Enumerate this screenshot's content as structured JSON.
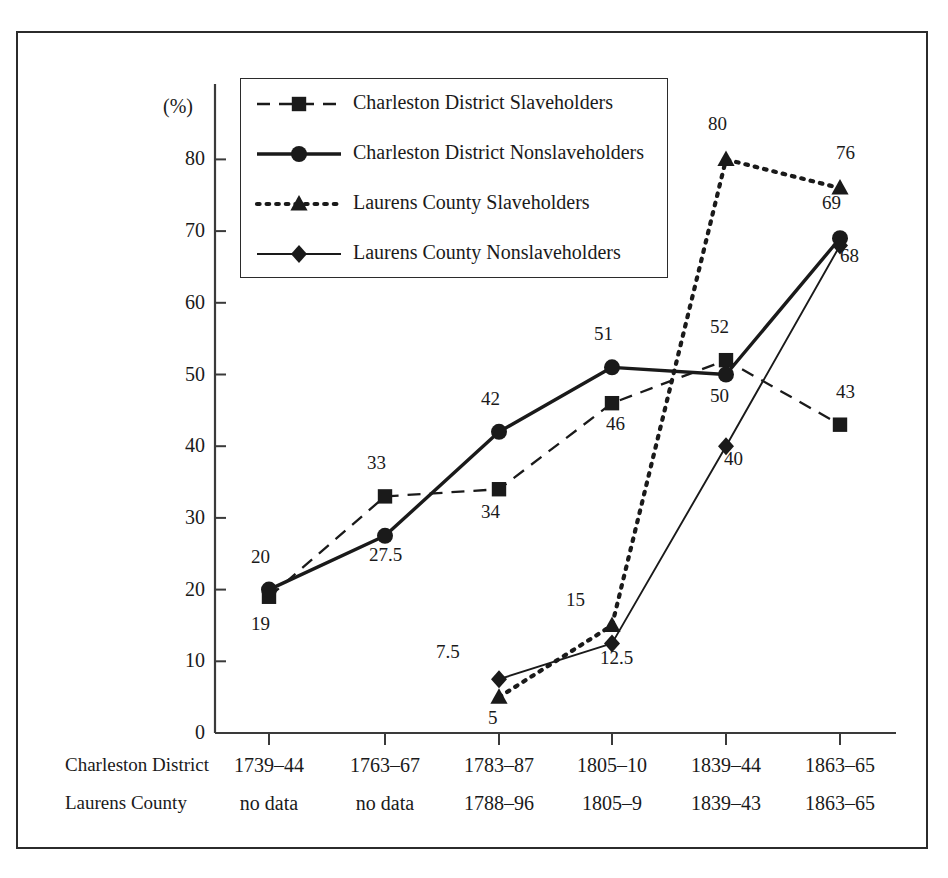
{
  "chart_data": {
    "type": "line",
    "title": "",
    "xlabel": "",
    "ylabel": "(%)",
    "ylim": [
      0,
      85
    ],
    "yticks": [
      0,
      10,
      20,
      30,
      40,
      50,
      60,
      70,
      80
    ],
    "grid": false,
    "legend_position": "top-left-inside",
    "categories": [
      "1",
      "2",
      "3",
      "4",
      "5",
      "6"
    ],
    "axis_rows": [
      {
        "row_label": "Charleston District",
        "values": [
          "1739–44",
          "1763–67",
          "1783–87",
          "1805–10",
          "1839–44",
          "1863–65"
        ]
      },
      {
        "row_label": "Laurens County",
        "values": [
          "no data",
          "no data",
          "1788–96",
          "1805–9",
          "1839–43",
          "1863–65"
        ]
      }
    ],
    "series": [
      {
        "name": "Charleston District Slaveholders",
        "marker": "square",
        "line_style": "dashed",
        "values": [
          19,
          33,
          34,
          46,
          52,
          43
        ],
        "labels": [
          "19",
          "33",
          "34",
          "46",
          "52",
          "43"
        ]
      },
      {
        "name": "Charleston District Nonslaveholders",
        "marker": "circle",
        "line_style": "solid-thick",
        "values": [
          20,
          27.5,
          42,
          51,
          50,
          69
        ],
        "labels": [
          "20",
          "27.5",
          "42",
          "51",
          "50",
          "69"
        ]
      },
      {
        "name": "Laurens County Slaveholders",
        "marker": "triangle",
        "line_style": "dotted",
        "values": [
          null,
          null,
          5,
          15,
          80,
          76
        ],
        "labels": [
          "",
          "",
          "5",
          "15",
          "80",
          "76"
        ]
      },
      {
        "name": "Laurens County Nonslaveholders",
        "marker": "diamond",
        "line_style": "solid-thin",
        "values": [
          null,
          null,
          7.5,
          12.5,
          40,
          68
        ],
        "labels": [
          "",
          "",
          "7.5",
          "12.5",
          "40",
          "68"
        ]
      }
    ]
  },
  "colors": {
    "ink": "#1a1a1a",
    "frame": "#2b2b2b",
    "axis": "#3a3a3a",
    "background": "#ffffff"
  }
}
